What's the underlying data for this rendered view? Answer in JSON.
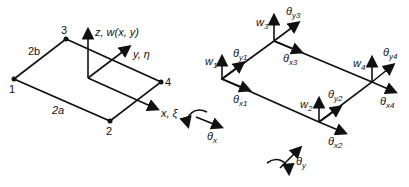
{
  "left_panel": {
    "nodes": [
      "1",
      "2",
      "3",
      "4"
    ],
    "dims": {
      "b_side": "2b",
      "a_side": "2a"
    },
    "axes": {
      "z": "z, w(x, y)",
      "y": "y, η",
      "x": "x, ξ"
    }
  },
  "right_panel": {
    "dofs": {
      "w1": "w",
      "w1_sub": "1",
      "ty1": "θ",
      "ty1_sub": "y1",
      "tx1": "θ",
      "tx1_sub": "x1",
      "w2": "w",
      "w2_sub": "2",
      "ty2": "θ",
      "ty2_sub": "y2",
      "tx2": "θ",
      "tx2_sub": "x2",
      "w3": "w",
      "w3_sub": "3",
      "ty3": "θ",
      "ty3_sub": "y3",
      "tx3": "θ",
      "tx3_sub": "x3",
      "w4": "w",
      "w4_sub": "4",
      "ty4": "θ",
      "ty4_sub": "y4",
      "tx4": "θ",
      "tx4_sub": "x4"
    },
    "rotation_legend": {
      "tx": "θ",
      "tx_sub": "x",
      "ty": "θ",
      "ty_sub": "y"
    }
  }
}
